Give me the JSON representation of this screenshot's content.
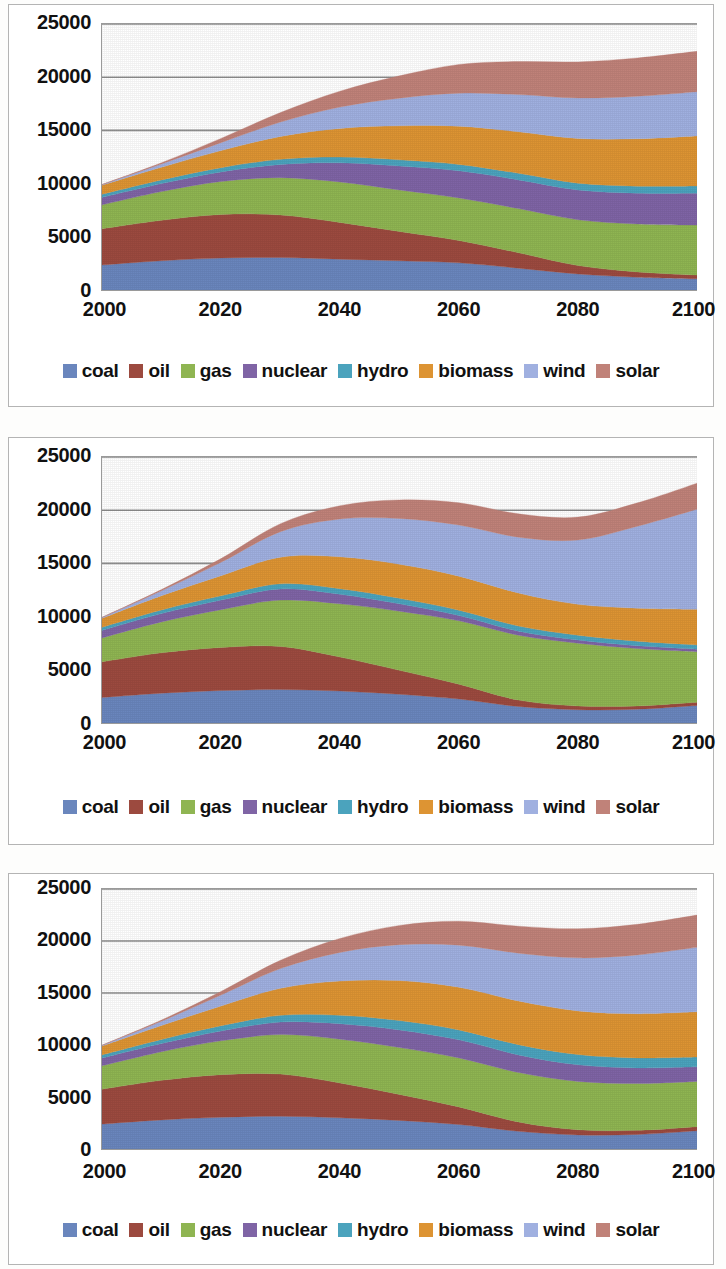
{
  "page": {
    "background": "#fdfdfc",
    "chart_count": 3
  },
  "series_colors": {
    "coal": "#6a86bd",
    "oil": "#9c4a3f",
    "gas": "#8fb552",
    "nuclear": "#7f64a5",
    "hydro": "#4ba3bd",
    "biomass": "#dd9433",
    "wind": "#a0b0e0",
    "solar": "#c08279"
  },
  "legend": {
    "items": [
      {
        "label": "coal",
        "color": "#6a86bd"
      },
      {
        "label": "oil",
        "color": "#9c4a3f"
      },
      {
        "label": "gas",
        "color": "#8fb552"
      },
      {
        "label": "nuclear",
        "color": "#7f64a5"
      },
      {
        "label": "hydro",
        "color": "#4ba3bd"
      },
      {
        "label": "biomass",
        "color": "#dd9433"
      },
      {
        "label": "wind",
        "color": "#a0b0e0"
      },
      {
        "label": "solar",
        "color": "#c08279"
      }
    ]
  },
  "axes": {
    "y_ticks": [
      "0",
      "5000",
      "10000",
      "15000",
      "20000",
      "25000"
    ],
    "y_values": [
      0,
      5000,
      10000,
      15000,
      20000,
      25000
    ],
    "x_ticks": [
      "2000",
      "2020",
      "2040",
      "2060",
      "2080",
      "2100"
    ],
    "x_values": [
      2000,
      2020,
      2040,
      2060,
      2080,
      2100
    ],
    "ylim": [
      0,
      25000
    ],
    "xlim": [
      2000,
      2100
    ],
    "gridlines": [
      15000,
      20000,
      25000
    ]
  },
  "chart_data": [
    {
      "id": "chart-1",
      "type": "area",
      "stacked": true,
      "title": "",
      "xlabel": "",
      "ylabel": "",
      "xlim": [
        2000,
        2100
      ],
      "ylim": [
        0,
        25000
      ],
      "grid": true,
      "legend_position": "bottom",
      "x": [
        2000,
        2010,
        2020,
        2030,
        2040,
        2050,
        2060,
        2070,
        2080,
        2090,
        2100
      ],
      "series": [
        {
          "name": "coal",
          "values": [
            2350,
            2750,
            3000,
            3050,
            2900,
            2750,
            2550,
            2050,
            1500,
            1200,
            1050
          ]
        },
        {
          "name": "oil",
          "values": [
            3400,
            3800,
            4100,
            4000,
            3450,
            2750,
            2100,
            1450,
            800,
            500,
            350
          ]
        },
        {
          "name": "gas",
          "values": [
            2250,
            2700,
            3100,
            3500,
            3800,
            3900,
            4000,
            4150,
            4300,
            4500,
            4700
          ]
        },
        {
          "name": "nuclear",
          "values": [
            700,
            750,
            900,
            1250,
            1800,
            2250,
            2550,
            2700,
            2800,
            2900,
            3000
          ]
        },
        {
          "name": "hydro",
          "values": [
            300,
            340,
            400,
            480,
            540,
            580,
            600,
            620,
            640,
            660,
            680
          ]
        },
        {
          "name": "biomass",
          "values": [
            850,
            1200,
            1600,
            2150,
            2700,
            3200,
            3600,
            3900,
            4200,
            4450,
            4700
          ]
        },
        {
          "name": "wind",
          "values": [
            50,
            300,
            750,
            1350,
            2000,
            2600,
            3100,
            3500,
            3800,
            4000,
            4150
          ]
        },
        {
          "name": "solar",
          "values": [
            20,
            120,
            400,
            900,
            1500,
            2100,
            2700,
            3100,
            3400,
            3600,
            3800
          ]
        }
      ]
    },
    {
      "id": "chart-2",
      "type": "area",
      "stacked": true,
      "title": "",
      "xlabel": "",
      "ylabel": "",
      "xlim": [
        2000,
        2100
      ],
      "ylim": [
        0,
        25000
      ],
      "grid": true,
      "legend_position": "bottom",
      "x": [
        2000,
        2010,
        2020,
        2030,
        2040,
        2050,
        2060,
        2070,
        2080,
        2090,
        2100
      ],
      "series": [
        {
          "name": "coal",
          "values": [
            2400,
            2800,
            3050,
            3150,
            3000,
            2700,
            2250,
            1550,
            1250,
            1300,
            1650
          ]
        },
        {
          "name": "oil",
          "values": [
            3350,
            3800,
            4050,
            4050,
            3200,
            2250,
            1400,
            600,
            350,
            300,
            300
          ]
        },
        {
          "name": "gas",
          "values": [
            2250,
            2900,
            3550,
            4350,
            5000,
            5550,
            5950,
            6100,
            5900,
            5400,
            4750
          ]
        },
        {
          "name": "nuclear",
          "values": [
            700,
            780,
            900,
            1050,
            900,
            700,
            500,
            380,
            300,
            260,
            240
          ]
        },
        {
          "name": "hydro",
          "values": [
            300,
            340,
            400,
            480,
            520,
            520,
            500,
            480,
            450,
            430,
            400
          ]
        },
        {
          "name": "biomass",
          "values": [
            850,
            1350,
            1900,
            2500,
            3000,
            3200,
            3200,
            3100,
            2900,
            3100,
            3350
          ]
        },
        {
          "name": "wind",
          "values": [
            60,
            450,
            1250,
            2400,
            3550,
            4300,
            4800,
            5250,
            6050,
            7700,
            9400
          ]
        },
        {
          "name": "solar",
          "values": [
            20,
            120,
            350,
            750,
            1250,
            1750,
            2100,
            2200,
            2150,
            2200,
            2450
          ]
        }
      ]
    },
    {
      "id": "chart-3",
      "type": "area",
      "stacked": true,
      "title": "",
      "xlabel": "",
      "ylabel": "",
      "xlim": [
        2000,
        2100
      ],
      "ylim": [
        0,
        25000
      ],
      "grid": true,
      "legend_position": "bottom",
      "x": [
        2000,
        2010,
        2020,
        2030,
        2040,
        2050,
        2060,
        2070,
        2080,
        2090,
        2100
      ],
      "series": [
        {
          "name": "coal",
          "values": [
            2400,
            2800,
            3050,
            3150,
            3000,
            2750,
            2350,
            1700,
            1350,
            1400,
            1750
          ]
        },
        {
          "name": "oil",
          "values": [
            3350,
            3800,
            4100,
            4050,
            3350,
            2500,
            1700,
            900,
            500,
            400,
            400
          ]
        },
        {
          "name": "gas",
          "values": [
            2250,
            2750,
            3250,
            3800,
            4200,
            4500,
            4700,
            4750,
            4650,
            4500,
            4350
          ]
        },
        {
          "name": "nuclear",
          "values": [
            750,
            800,
            950,
            1200,
            1500,
            1700,
            1750,
            1700,
            1600,
            1500,
            1400
          ]
        },
        {
          "name": "hydro",
          "values": [
            300,
            380,
            500,
            650,
            800,
            900,
            950,
            980,
            980,
            960,
            940
          ]
        },
        {
          "name": "biomass",
          "values": [
            850,
            1350,
            1900,
            2600,
            3300,
            3850,
            4100,
            4200,
            4200,
            4250,
            4350
          ]
        },
        {
          "name": "wind",
          "values": [
            60,
            400,
            1050,
            1900,
            2750,
            3450,
            4050,
            4600,
            5100,
            5650,
            6200
          ]
        },
        {
          "name": "solar",
          "values": [
            20,
            120,
            350,
            800,
            1350,
            1850,
            2300,
            2600,
            2800,
            2950,
            3100
          ]
        }
      ]
    }
  ]
}
